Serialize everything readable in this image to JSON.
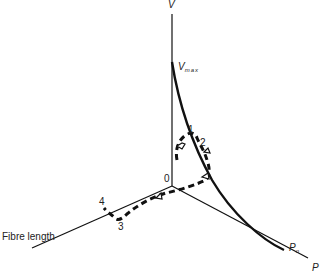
{
  "diagram": {
    "axes": {
      "v_label": "V",
      "p_label": "P",
      "fibre_label": "Fibre length",
      "origin_label": "0"
    },
    "curve_labels": {
      "vmax_main": "V",
      "vmax_sub": "max",
      "p0_main": "P",
      "p0_sub": "o"
    },
    "points": [
      {
        "label": "1"
      },
      {
        "label": "2"
      },
      {
        "label": "3"
      },
      {
        "label": "4"
      }
    ],
    "colors": {
      "line": "#111111",
      "text": "#222222",
      "background": "#ffffff"
    }
  }
}
